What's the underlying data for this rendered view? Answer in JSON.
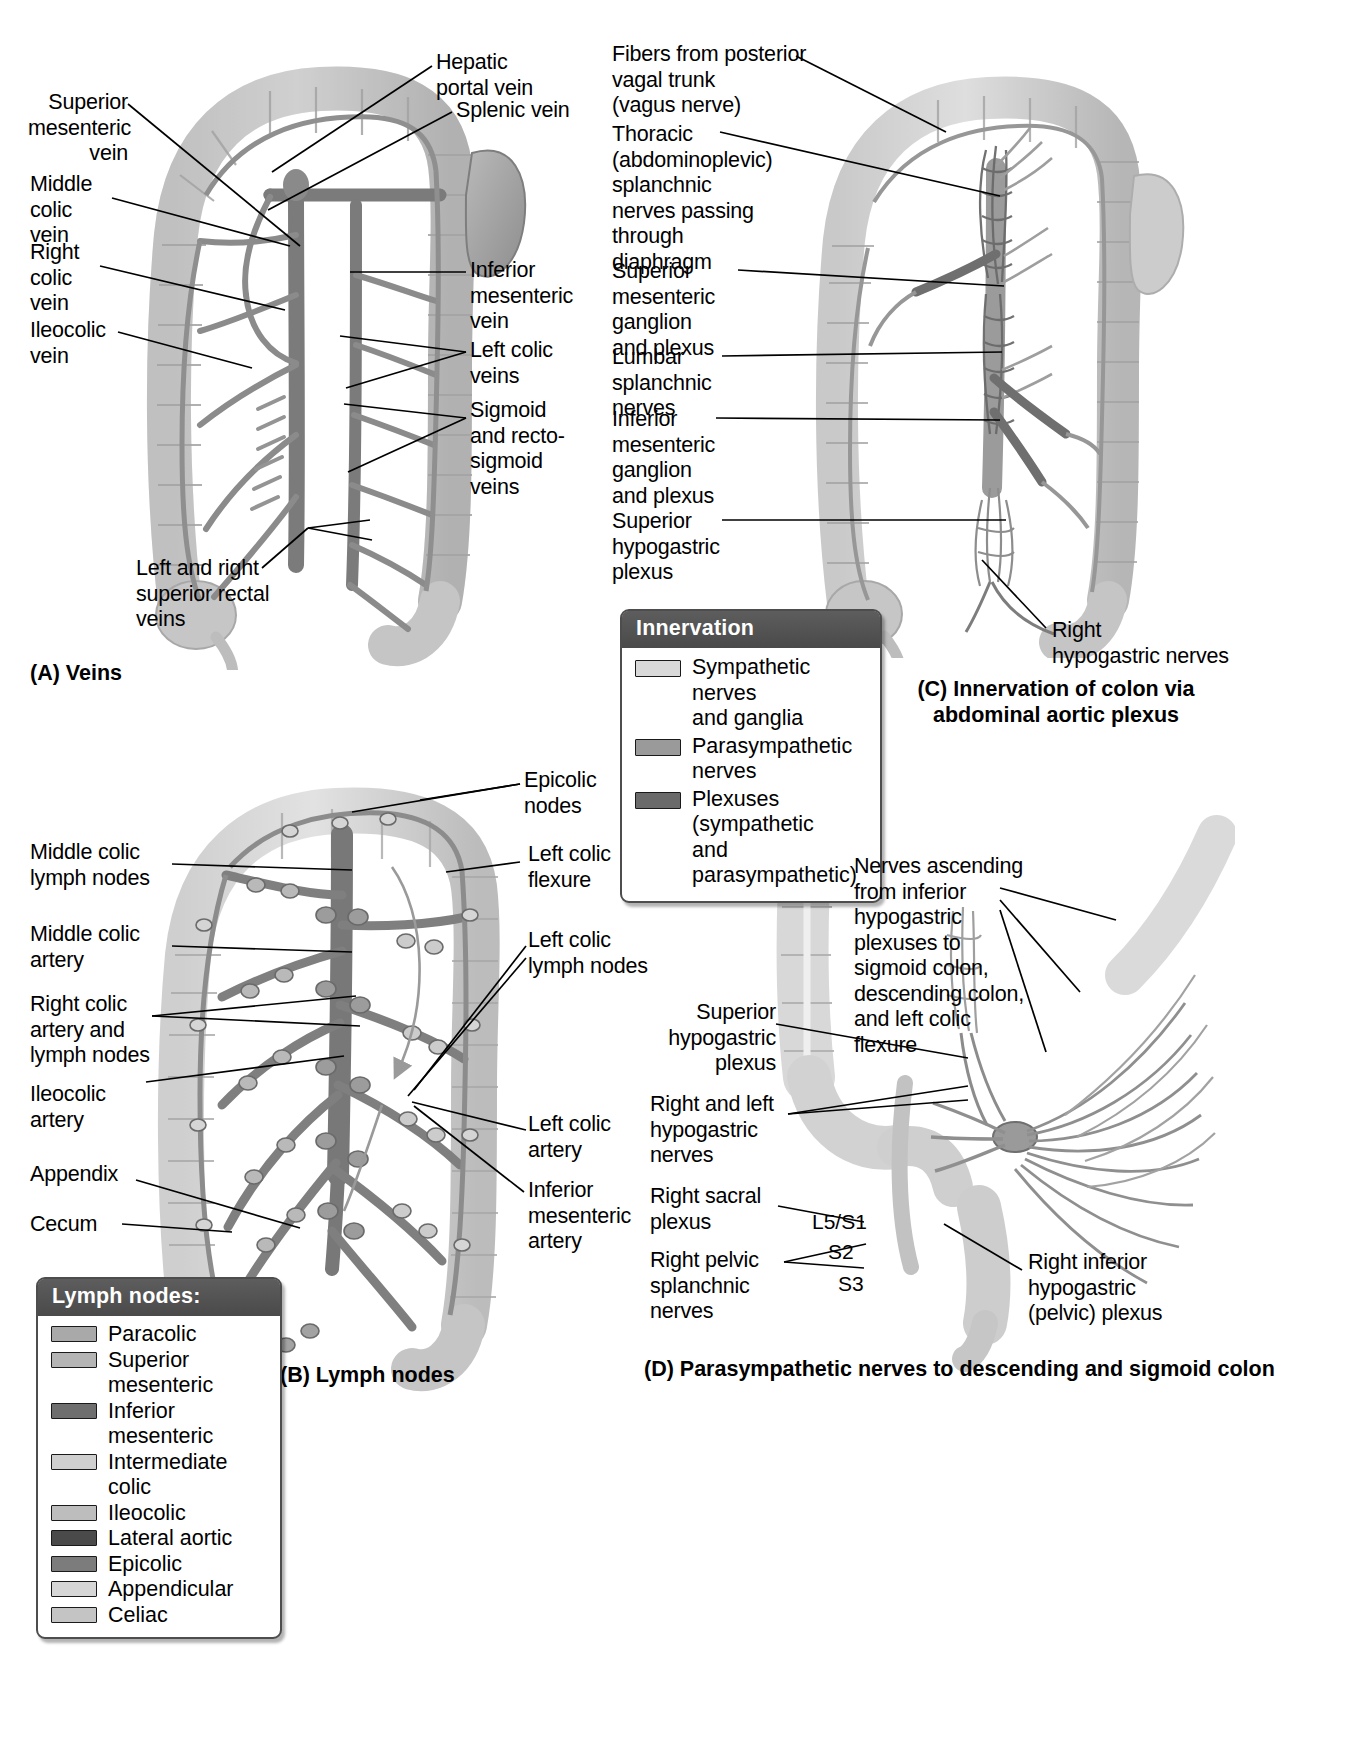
{
  "panel_a": {
    "caption": "(A) Veins",
    "labels": {
      "superior_mesenteric_vein": "Superior\nmesenteric\nvein",
      "middle_colic_vein": "Middle\ncolic\nvein",
      "right_colic_vein": "Right\ncolic\nvein",
      "ileocolic_vein": "Ileocolic\nvein",
      "hepatic_portal_vein": "Hepatic\nportal vein",
      "splenic_vein": "Splenic vein",
      "inferior_mesenteric_vein": "Inferior\nmesenteric\nvein",
      "left_colic_veins": "Left colic\nveins",
      "sigmoid_and_rectosigmoid_veins": "Sigmoid\nand recto-\nsigmoid\nveins",
      "superior_rectal_veins": "Left and right\nsuperior rectal\nveins"
    }
  },
  "panel_b": {
    "caption": "(B) Lymph nodes",
    "labels": {
      "epicolic_nodes": "Epicolic\nnodes",
      "middle_colic_lymph_nodes": "Middle colic\nlymph nodes",
      "middle_colic_artery": "Middle colic\nartery",
      "right_colic_artery_and_lymph_nodes": "Right colic\nartery and\nlymph nodes",
      "ileocolic_artery": "Ileocolic\nartery",
      "appendix": "Appendix",
      "cecum": "Cecum",
      "left_colic_flexure": "Left colic\nflexure",
      "left_colic_lymph_nodes": "Left colic\nlymph nodes",
      "left_colic_artery": "Left colic\nartery",
      "inferior_mesenteric_artery": "Inferior\nmesenteric\nartery"
    },
    "legend": {
      "title": "Lymph nodes:",
      "items": [
        {
          "label": "Paracolic",
          "color": "#a9a9a9"
        },
        {
          "label": "Superior mesenteric",
          "color": "#b4b4b4"
        },
        {
          "label": "Inferior mesenteric",
          "color": "#6e6e6e"
        },
        {
          "label": "Intermediate colic",
          "color": "#cfcfcf"
        },
        {
          "label": "Ileocolic",
          "color": "#bdbdbd"
        },
        {
          "label": "Lateral aortic",
          "color": "#4a4a4a"
        },
        {
          "label": "Epicolic",
          "color": "#7c7c7c"
        },
        {
          "label": "Appendicular",
          "color": "#d6d6d6"
        },
        {
          "label": "Celiac",
          "color": "#c4c4c4"
        }
      ]
    }
  },
  "panel_c": {
    "caption": "(C) Innervation of colon via\nabdominal aortic plexus",
    "labels": {
      "vagal_fibers": "Fibers from posterior\nvagal trunk\n(vagus nerve)",
      "thoracic_splanchnic": "Thoracic\n(abdominoplevic)\nsplanchnic\nnerves passing\nthrough\ndiaphragm",
      "superior_mesenteric_ganglion": "Superior\nmesenteric\nganglion\nand plexus",
      "lumbar_splanchnic_nerves": "Lumbar\nsplanchnic\nnerves",
      "inferior_mesenteric_ganglion": "Inferior\nmesenteric\nganglion\nand plexus",
      "superior_hypogastric_plexus": "Superior\nhypogastric\nplexus",
      "right_hypogastric_nerves": "Right\nhypogastric nerves"
    },
    "legend": {
      "title": "Innervation",
      "items": [
        {
          "label": "Sympathetic nerves\nand ganglia",
          "color": "#d9d9d9"
        },
        {
          "label": "Parasympathetic\nnerves",
          "color": "#9a9a9a"
        },
        {
          "label": "Plexuses (sympathetic\nand parasympathetic)",
          "color": "#6a6a6a"
        }
      ]
    }
  },
  "panel_d": {
    "caption": "(D) Parasympathetic nerves to descending and sigmoid colon",
    "labels": {
      "nerves_ascending": "Nerves ascending\nfrom inferior\nhypogastric\nplexuses to\nsigmoid colon,\ndescending colon,\nand left colic\nflexure",
      "superior_hypogastric_plexus": "Superior\nhypogastric\nplexus",
      "right_and_left_hypogastric_nerves": "Right and left\nhypogastric\nnerves",
      "right_sacral_plexus": "Right sacral\nplexus",
      "right_pelvic_splanchnic_nerves": "Right pelvic\nsplanchnic\nnerves",
      "right_inferior_hypogastric_plexus": "Right inferior\nhypogastric\n(pelvic) plexus"
    },
    "spinal_levels": [
      {
        "name": "l5-s1",
        "text": "L5/S1"
      },
      {
        "name": "s2",
        "text": "S2"
      },
      {
        "name": "s3",
        "text": "S3"
      }
    ]
  },
  "colors": {
    "ink": "#000000",
    "legend_header": "#535353",
    "legend_border": "#4d4d4d",
    "gut_light": "#d2d2d2",
    "gut_mid": "#b5b5b5",
    "vessel_dark": "#6f6f6f",
    "vessel_mid": "#8c8c8c"
  }
}
